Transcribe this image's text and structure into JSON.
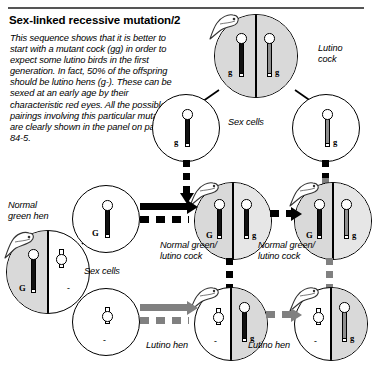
{
  "page": {
    "title": "Sex-linked recessive mutation/2",
    "body_text": "This sequence shows that it is better to start with a mutant cock (gg) in order to expect some lutino birds in the first generation. In fact, 50% of the offspring should be lutino hens (g-). These can be sexed at an early age by their characteristic red eyes. All the possible pairings involving this particular mutation are clearly shown in the panel on pages 84-5."
  },
  "colors": {
    "ink": "#000000",
    "shade": "#d9d9d9",
    "chromosome_dark": "#111111",
    "chromosome_grey": "#8e8e8e",
    "arrow_black": "#000000",
    "arrow_grey": "#808080"
  },
  "labels": {
    "lutino_cock": "Lutino\ncock",
    "lutino_cock_line1": "Lutino",
    "lutino_cock_line2": "cock",
    "sex_cells_top": "Sex cells",
    "sex_cells_left": "Sex cells",
    "normal_green_hen_line1": "Normal",
    "normal_green_hen_line2": "green hen",
    "cock_mid_left_line1": "Normal green/",
    "cock_mid_left_line2": "lutino cock",
    "cock_mid_right_line1": "Normal green/",
    "cock_mid_right_line2": "lutino cock",
    "lutino_hen_left": "Lutino hen",
    "lutino_hen_right": "Lutino hen"
  },
  "alleles": {
    "g_lower": "g",
    "G_upper": "G",
    "none": "-"
  },
  "cells": {
    "parent_lutino_cock": {
      "name": "Lutino cock",
      "genotype": "gg",
      "left_allele": "g",
      "right_allele": "g",
      "left_color": "#111111",
      "right_color": "#8e8e8e",
      "shaded": true
    },
    "sex_cell_cock_left": {
      "name": "Sex cell",
      "allele": "g",
      "color": "#111111",
      "shaded": false
    },
    "sex_cell_cock_right": {
      "name": "Sex cell",
      "allele": "g",
      "color": "#8e8e8e",
      "shaded": false
    },
    "parent_normal_green_hen": {
      "name": "Normal green hen",
      "genotype": "G-",
      "left_allele": "G",
      "right_allele": "-",
      "left_color": "#111111",
      "shaded": true
    },
    "sex_cell_hen_G": {
      "name": "Sex cell",
      "allele": "G",
      "color": "#111111",
      "shaded": false
    },
    "sex_cell_hen_none": {
      "name": "Sex cell",
      "allele": "-",
      "color": "#8e8e8e",
      "shaded": false
    },
    "offspring_cock_left": {
      "name": "Normal green/lutino cock",
      "genotype": "Gg",
      "left_allele": "G",
      "right_allele": "g",
      "left_color": "#111111",
      "right_color": "#111111",
      "shaded": true
    },
    "offspring_cock_right": {
      "name": "Normal green/lutino cock",
      "genotype": "Gg",
      "left_allele": "G",
      "right_allele": "g",
      "left_color": "#111111",
      "right_color": "#8e8e8e",
      "shaded": true
    },
    "offspring_hen_left": {
      "name": "Lutino hen",
      "genotype": "g-",
      "left_allele": "-",
      "right_allele": "g",
      "right_color": "#111111",
      "shaded": true
    },
    "offspring_hen_right": {
      "name": "Lutino hen",
      "genotype": "g-",
      "left_allele": "-",
      "right_allele": "g",
      "right_color": "#8e8e8e",
      "shaded": true
    }
  }
}
